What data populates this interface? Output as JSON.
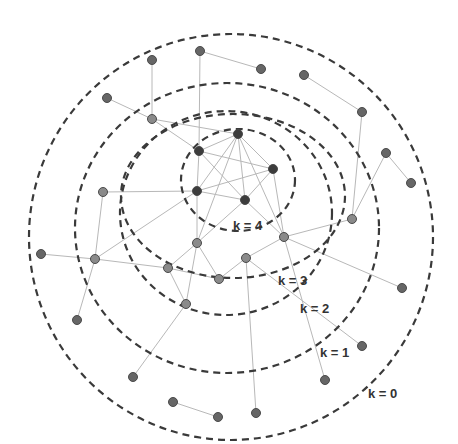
{
  "diagram": {
    "colors": {
      "background": "#ffffff",
      "shell_stroke": "#3a3a3a",
      "edge": "#b8b8b8",
      "node_core": "#3c3c3c",
      "node_inner": "#8a8a8a",
      "node_outer": "#666666",
      "node_stroke": "#4a4a4a",
      "label": "#333333"
    },
    "shells": [
      {
        "k": 0,
        "label": "k = 0",
        "cx": 231,
        "cy": 237,
        "rx": 202,
        "ry": 203,
        "label_x": 368,
        "label_y": 398
      },
      {
        "k": 1,
        "label": "k = 1",
        "cx": 227,
        "cy": 225,
        "rx": 152,
        "ry": 142,
        "label_x": 320,
        "label_y": 357
      },
      {
        "k": 2,
        "label": "k = 2",
        "cx": 225,
        "cy": 220,
        "rx": 107,
        "ry": 107,
        "label_x": 300,
        "label_y": 313
      },
      {
        "k": 3,
        "label": "k = 3",
        "cx": 236,
        "cy": 183,
        "rx": 60,
        "ry": 55,
        "label_x": 278,
        "label_y": 285
      },
      {
        "k": 4,
        "label": "k = 4",
        "cx": 236,
        "cy": 183,
        "rx": 60,
        "ry": 55,
        "label_x": 233,
        "label_y": 230
      }
    ],
    "nodes": [
      {
        "id": "c1",
        "x": 238,
        "y": 134,
        "shell": 4
      },
      {
        "id": "c2",
        "x": 199,
        "y": 151,
        "shell": 4
      },
      {
        "id": "c3",
        "x": 273,
        "y": 169,
        "shell": 4
      },
      {
        "id": "c4",
        "x": 197,
        "y": 191,
        "shell": 4
      },
      {
        "id": "c5",
        "x": 245,
        "y": 200,
        "shell": 4
      },
      {
        "id": "i1",
        "x": 197,
        "y": 243,
        "shell": 3
      },
      {
        "id": "i2",
        "x": 284,
        "y": 237,
        "shell": 3
      },
      {
        "id": "i3",
        "x": 246,
        "y": 258,
        "shell": 3
      },
      {
        "id": "i4",
        "x": 168,
        "y": 268,
        "shell": 3
      },
      {
        "id": "i5",
        "x": 219,
        "y": 279,
        "shell": 3
      },
      {
        "id": "i6",
        "x": 186,
        "y": 304,
        "shell": 3
      },
      {
        "id": "s1",
        "x": 152,
        "y": 119,
        "shell": 2
      },
      {
        "id": "s2",
        "x": 103,
        "y": 192,
        "shell": 2
      },
      {
        "id": "s3",
        "x": 95,
        "y": 259,
        "shell": 2
      },
      {
        "id": "s4",
        "x": 352,
        "y": 219,
        "shell": 2
      },
      {
        "id": "o1",
        "x": 200,
        "y": 51,
        "shell": 1
      },
      {
        "id": "o2",
        "x": 152,
        "y": 60,
        "shell": 1
      },
      {
        "id": "o3",
        "x": 107,
        "y": 98,
        "shell": 1
      },
      {
        "id": "o4",
        "x": 261,
        "y": 69,
        "shell": 1
      },
      {
        "id": "o5",
        "x": 304,
        "y": 75,
        "shell": 1
      },
      {
        "id": "o6",
        "x": 362,
        "y": 112,
        "shell": 1
      },
      {
        "id": "o7",
        "x": 386,
        "y": 153,
        "shell": 1
      },
      {
        "id": "o8",
        "x": 411,
        "y": 183,
        "shell": 1
      },
      {
        "id": "o9",
        "x": 41,
        "y": 254,
        "shell": 1
      },
      {
        "id": "o10",
        "x": 77,
        "y": 320,
        "shell": 1
      },
      {
        "id": "o11",
        "x": 402,
        "y": 288,
        "shell": 1
      },
      {
        "id": "o12",
        "x": 362,
        "y": 346,
        "shell": 1
      },
      {
        "id": "o13",
        "x": 325,
        "y": 380,
        "shell": 1
      },
      {
        "id": "o14",
        "x": 133,
        "y": 377,
        "shell": 1
      },
      {
        "id": "o15",
        "x": 256,
        "y": 413,
        "shell": 1
      },
      {
        "id": "o16",
        "x": 173,
        "y": 402,
        "shell": 1
      },
      {
        "id": "o17",
        "x": 218,
        "y": 417,
        "shell": 1
      }
    ],
    "edges": [
      [
        "c1",
        "c2"
      ],
      [
        "c1",
        "c3"
      ],
      [
        "c1",
        "c4"
      ],
      [
        "c1",
        "c5"
      ],
      [
        "c2",
        "c3"
      ],
      [
        "c2",
        "c5"
      ],
      [
        "c3",
        "c4"
      ],
      [
        "c3",
        "c5"
      ],
      [
        "c4",
        "c5"
      ],
      [
        "c2",
        "c4"
      ],
      [
        "c1",
        "i1"
      ],
      [
        "c1",
        "i2"
      ],
      [
        "c2",
        "o1"
      ],
      [
        "c2",
        "s1"
      ],
      [
        "c4",
        "s2"
      ],
      [
        "c4",
        "s3"
      ],
      [
        "c5",
        "i1"
      ],
      [
        "c5",
        "i2"
      ],
      [
        "c3",
        "i2"
      ],
      [
        "c4",
        "i1"
      ],
      [
        "i1",
        "i4"
      ],
      [
        "i1",
        "i5"
      ],
      [
        "i1",
        "i6"
      ],
      [
        "i4",
        "i5"
      ],
      [
        "i4",
        "i6"
      ],
      [
        "i5",
        "i3"
      ],
      [
        "i3",
        "i2"
      ],
      [
        "i3",
        "o12"
      ],
      [
        "i3",
        "o15"
      ],
      [
        "i2",
        "s4"
      ],
      [
        "i2",
        "o11"
      ],
      [
        "i6",
        "o14"
      ],
      [
        "s3",
        "i4"
      ],
      [
        "s3",
        "o9"
      ],
      [
        "s3",
        "o10"
      ],
      [
        "s3",
        "s2"
      ],
      [
        "s1",
        "o2"
      ],
      [
        "s1",
        "o3"
      ],
      [
        "s1",
        "c1"
      ],
      [
        "o1",
        "o4"
      ],
      [
        "o5",
        "o6"
      ],
      [
        "o6",
        "s4"
      ],
      [
        "s4",
        "o7"
      ],
      [
        "o7",
        "o8"
      ],
      [
        "i2",
        "o13"
      ],
      [
        "o16",
        "o17"
      ]
    ]
  }
}
